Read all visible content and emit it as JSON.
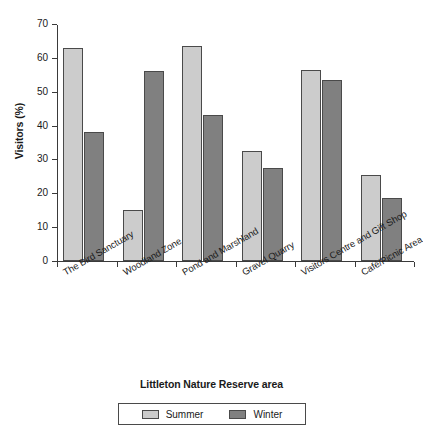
{
  "chart_data": {
    "type": "bar",
    "title": "",
    "xlabel": "Littleton Nature Reserve area",
    "ylabel": "Visitors (%)",
    "ylim": [
      0,
      70
    ],
    "ytick_step": 10,
    "yticks": [
      0,
      10,
      20,
      30,
      40,
      50,
      60,
      70
    ],
    "grid": false,
    "legend_position": "bottom",
    "categories": [
      "The Bird Sanctuary",
      "Woodland Zone",
      "Pond and Marshland",
      "Gravel Quarry",
      "Visitors Centre and Gift Shop",
      "Café/Picnic Area"
    ],
    "series": [
      {
        "name": "Summer",
        "color": "#cccccc",
        "values": [
          63,
          15,
          63.5,
          32.5,
          56.5,
          25.5
        ]
      },
      {
        "name": "Winter",
        "color": "#808080",
        "values": [
          38,
          56,
          43,
          27.5,
          53.5,
          18.7
        ]
      }
    ]
  },
  "legend": {
    "entries": [
      {
        "label": "Summer",
        "color": "#cccccc"
      },
      {
        "label": "Winter",
        "color": "#808080"
      }
    ]
  }
}
